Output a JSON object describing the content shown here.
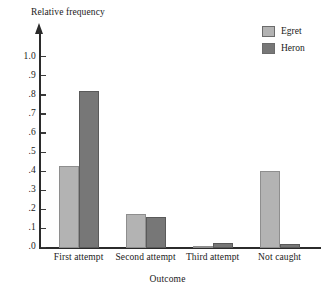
{
  "chart_data": {
    "type": "bar",
    "title": "",
    "ylabel": "Relative frequency",
    "xlabel": "Outcome",
    "categories": [
      "First attempt",
      "Second attempt",
      "Third attempt",
      "Not caught"
    ],
    "series": [
      {
        "name": "Egret",
        "color": "#b3b3b3",
        "values": [
          0.43,
          0.175,
          0.01,
          0.4
        ]
      },
      {
        "name": "Heron",
        "color": "#777777",
        "values": [
          0.82,
          0.16,
          0.025,
          0.02
        ]
      }
    ],
    "ylim": [
      0.0,
      1.0
    ],
    "ytick_labels": [
      "1.0",
      ".9",
      ".8",
      ".7",
      ".6",
      ".5",
      ".4",
      ".3",
      ".2",
      ".1",
      ".0"
    ],
    "ytick_values": [
      1.0,
      0.9,
      0.8,
      0.7,
      0.6,
      0.5,
      0.4,
      0.3,
      0.2,
      0.1,
      0.0
    ],
    "grid": false,
    "legend_position": "top-right",
    "axis_color": "#2b2b2b",
    "background": "#ffffff"
  },
  "legend": {
    "items": [
      {
        "label": "Egret"
      },
      {
        "label": "Heron"
      }
    ]
  }
}
